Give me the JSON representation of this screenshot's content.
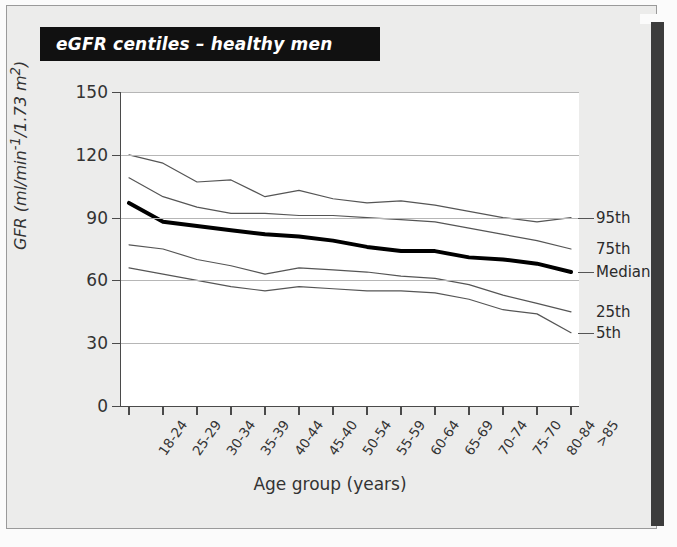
{
  "figure": {
    "title": "eGFR centiles – healthy men",
    "x_axis_title": "Age group (years)",
    "y_axis_title": "GFR (ml/min-1/1.73 m2)"
  },
  "legend": {
    "items": [
      {
        "label": "95th",
        "value": 90
      },
      {
        "label": "75th",
        "value": 75
      },
      {
        "label": "Median",
        "value": 68
      },
      {
        "label": "25th",
        "value": 52
      },
      {
        "label": "5th",
        "value": 35
      }
    ]
  },
  "chart_data": {
    "type": "line",
    "title": "eGFR centiles – healthy men",
    "xlabel": "Age group (years)",
    "ylabel": "GFR (ml/min-1/1.73 m2)",
    "ylim": [
      0,
      150
    ],
    "yticks": [
      0,
      30,
      60,
      90,
      120,
      150
    ],
    "grid": true,
    "legend_position": "right",
    "categories": [
      "18-24",
      "25-29",
      "30-34",
      "35-39",
      "40-44",
      "45-40",
      "50-54",
      "55-59",
      "60-64",
      "65-69",
      "70-74",
      "75-70",
      "80-84",
      ">85"
    ],
    "series": [
      {
        "name": "95th",
        "values": [
          120,
          116,
          107,
          108,
          100,
          103,
          99,
          97,
          98,
          96,
          93,
          90,
          88,
          90
        ]
      },
      {
        "name": "75th",
        "values": [
          109,
          100,
          95,
          92,
          92,
          91,
          91,
          90,
          89,
          88,
          85,
          82,
          79,
          75
        ]
      },
      {
        "name": "Median",
        "values": [
          97,
          88,
          86,
          84,
          82,
          81,
          79,
          76,
          74,
          74,
          71,
          70,
          68,
          64
        ]
      },
      {
        "name": "25th",
        "values": [
          77,
          75,
          70,
          67,
          63,
          66,
          65,
          64,
          62,
          61,
          58,
          53,
          49,
          45
        ]
      },
      {
        "name": "5th",
        "values": [
          66,
          63,
          60,
          57,
          55,
          57,
          56,
          55,
          55,
          54,
          51,
          46,
          44,
          35
        ]
      }
    ]
  }
}
